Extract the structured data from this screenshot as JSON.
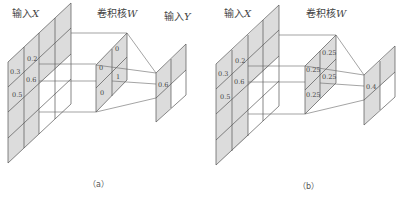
{
  "colors": {
    "shade": "#dcdcdc",
    "line": "#555555",
    "background": "#ffffff",
    "text": "#444444"
  },
  "panels": [
    {
      "id": "a",
      "caption": "（a）",
      "input_label": "输入",
      "input_var": "X",
      "kernel_label": "卷积核",
      "kernel_var": "W",
      "output_label": "输入",
      "output_var": "Y",
      "input_values": [
        "0.2",
        "0.3",
        "0.6",
        "0.5"
      ],
      "kernel_values": [
        "0",
        "0",
        "1",
        "0"
      ],
      "output_values": [
        "0.6"
      ]
    },
    {
      "id": "b",
      "caption": "（b）",
      "input_label": "输入",
      "input_var": "X",
      "kernel_label": "卷积核",
      "kernel_var": "W",
      "input_values": [
        "0.2",
        "0.3",
        "0.6",
        "0.5"
      ],
      "kernel_values": [
        "0.25",
        "0.25",
        "0.25",
        "0.25"
      ],
      "output_values": [
        "0.4"
      ]
    }
  ]
}
